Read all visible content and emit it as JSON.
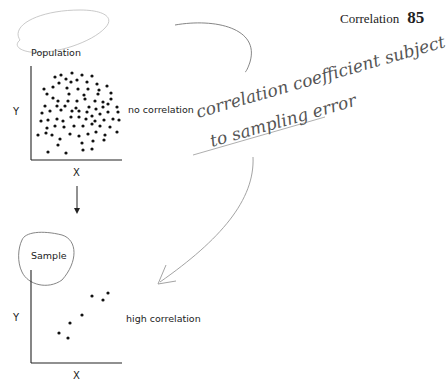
{
  "running_head": {
    "title": "Correlation",
    "page_number": "85"
  },
  "population_panel": {
    "label": "Population",
    "y_axis_label": "Y",
    "x_axis_label": "X",
    "annotation": "no correlation"
  },
  "sample_panel": {
    "label": "Sample",
    "y_axis_label": "Y",
    "x_axis_label": "X",
    "annotation": "high correlation"
  },
  "handwritten_note": {
    "line1": "correlation coefficient subject",
    "line2": "to sampling error"
  },
  "chart_data": [
    {
      "type": "scatter",
      "title": "Population",
      "xlabel": "X",
      "ylabel": "Y",
      "annotation": "no correlation",
      "grid": false,
      "points_pixel": [
        [
          55,
          77
        ],
        [
          61,
          75
        ],
        [
          72,
          73
        ],
        [
          82,
          75
        ],
        [
          92,
          76
        ],
        [
          59,
          83
        ],
        [
          66,
          79
        ],
        [
          71,
          82
        ],
        [
          77,
          80
        ],
        [
          87,
          82
        ],
        [
          97,
          84
        ],
        [
          44,
          89
        ],
        [
          53,
          87
        ],
        [
          67,
          88
        ],
        [
          78,
          89
        ],
        [
          88,
          89
        ],
        [
          99,
          90
        ],
        [
          107,
          86
        ],
        [
          47,
          94
        ],
        [
          69,
          94
        ],
        [
          84,
          95
        ],
        [
          98,
          94
        ],
        [
          111,
          93
        ],
        [
          53,
          98
        ],
        [
          58,
          101
        ],
        [
          68,
          101
        ],
        [
          77,
          101
        ],
        [
          85,
          99
        ],
        [
          95,
          101
        ],
        [
          103,
          102
        ],
        [
          111,
          99
        ],
        [
          45,
          106
        ],
        [
          57,
          106
        ],
        [
          65,
          106
        ],
        [
          76,
          108
        ],
        [
          89,
          107
        ],
        [
          96,
          109
        ],
        [
          103,
          107
        ],
        [
          108,
          104
        ],
        [
          117,
          107
        ],
        [
          42,
          113
        ],
        [
          50,
          111
        ],
        [
          61,
          110
        ],
        [
          72,
          111
        ],
        [
          79,
          111
        ],
        [
          87,
          112
        ],
        [
          92,
          116
        ],
        [
          100,
          114
        ],
        [
          108,
          112
        ],
        [
          118,
          112
        ],
        [
          41,
          121
        ],
        [
          48,
          120
        ],
        [
          57,
          119
        ],
        [
          63,
          121
        ],
        [
          71,
          117
        ],
        [
          79,
          117
        ],
        [
          86,
          119
        ],
        [
          95,
          121
        ],
        [
          104,
          120
        ],
        [
          113,
          119
        ],
        [
          119,
          120
        ],
        [
          47,
          128
        ],
        [
          55,
          126
        ],
        [
          64,
          127
        ],
        [
          74,
          126
        ],
        [
          83,
          126
        ],
        [
          92,
          124
        ],
        [
          100,
          126
        ],
        [
          110,
          127
        ],
        [
          38,
          135
        ],
        [
          46,
          133
        ],
        [
          52,
          135
        ],
        [
          60,
          139
        ],
        [
          70,
          134
        ],
        [
          79,
          136
        ],
        [
          88,
          134
        ],
        [
          96,
          132
        ],
        [
          105,
          135
        ],
        [
          117,
          132
        ],
        [
          58,
          145
        ],
        [
          82,
          143
        ],
        [
          93,
          141
        ],
        [
          104,
          140
        ],
        [
          48,
          152
        ],
        [
          66,
          153
        ],
        [
          83,
          150
        ],
        [
          92,
          149
        ]
      ]
    },
    {
      "type": "scatter",
      "title": "Sample",
      "xlabel": "X",
      "ylabel": "Y",
      "annotation": "high correlation",
      "grid": false,
      "points_pixel": [
        [
          59,
          333
        ],
        [
          68,
          338
        ],
        [
          70,
          323
        ],
        [
          82,
          315
        ],
        [
          92,
          296
        ],
        [
          103,
          300
        ],
        [
          108,
          293
        ]
      ]
    }
  ]
}
